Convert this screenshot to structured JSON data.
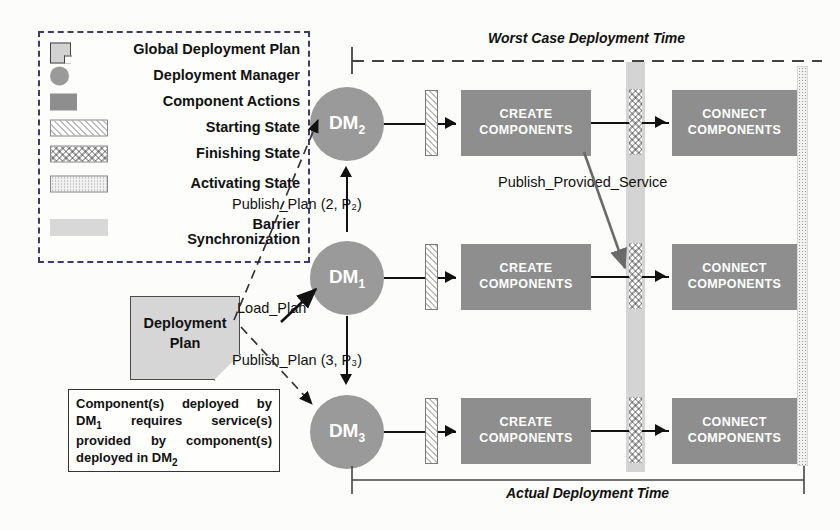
{
  "legend": {
    "items": [
      {
        "symbol": "global-deployment-plan-symbol",
        "label": "Global Deployment Plan"
      },
      {
        "symbol": "deployment-manager-symbol",
        "label": "Deployment Manager"
      },
      {
        "symbol": "component-actions-symbol",
        "label": "Component Actions"
      },
      {
        "symbol": "starting-state-symbol",
        "label": "Starting State"
      },
      {
        "symbol": "finishing-state-symbol",
        "label": "Finishing State"
      },
      {
        "symbol": "activating-state-symbol",
        "label": "Activating State"
      },
      {
        "symbol": "barrier-synchronization-symbol",
        "label": "Barrier\nSynchronization"
      }
    ]
  },
  "deployment_plan": {
    "line1": "Deployment",
    "line2": "Plan"
  },
  "note": {
    "text": "Component(s) deployed by DM₁ requires service(s) provided by component(s) deployed in DM₂",
    "html": "Component(s) deployed by DM<sub>1</sub> requires service(s) provided by component(s) deployed in DM<sub>2</sub>"
  },
  "managers": [
    {
      "id": "dm2",
      "label": "DM",
      "sub": "2"
    },
    {
      "id": "dm1",
      "label": "DM",
      "sub": "1"
    },
    {
      "id": "dm3",
      "label": "DM",
      "sub": "3"
    }
  ],
  "actions": {
    "create": "CREATE\nCOMPONENTS",
    "create_line1": "CREATE",
    "create_line2": "COMPONENTS",
    "connect_line1": "CONNECT",
    "connect_line2": "COMPONENTS"
  },
  "messages": {
    "load_plan": "Load_Plan",
    "publish_plan_2": "Publish_Plan (2, P₂)",
    "publish_plan_3": "Publish_Plan (3, P₃)",
    "publish_provided_service": "Publish_Provided_Service"
  },
  "timeline": {
    "worst_case": "Worst Case Deployment Time",
    "actual": "Actual Deployment Time"
  },
  "colors": {
    "manager_fill": "#9a9a9a",
    "action_fill": "#8e8e8e",
    "barrier_fill": "#d4d4d4",
    "doc_fill": "#d6d6d6",
    "legend_border": "#3b3b6e",
    "line": "#111111"
  }
}
